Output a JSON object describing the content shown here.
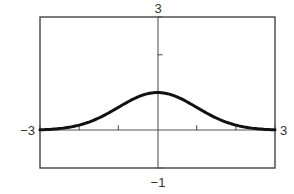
{
  "chart_data": {
    "type": "line",
    "title": "",
    "xlabel": "",
    "ylabel": "",
    "function": "y = e^(-x^2/2)",
    "xlim": [
      -3,
      3
    ],
    "ylim": [
      -1,
      3
    ],
    "grid": false,
    "legend": null,
    "x_tick_step": 1,
    "y_tick_step": 1,
    "window_labels": {
      "xmin": "−3",
      "xmax": "3",
      "ymin": "−1",
      "ymax": "3"
    },
    "series": [
      {
        "name": "curve",
        "x": [
          -3,
          -2.5,
          -2,
          -1.5,
          -1,
          -0.5,
          0,
          0.5,
          1,
          1.5,
          2,
          2.5,
          3
        ],
        "y": [
          0.01,
          0.04,
          0.14,
          0.32,
          0.61,
          0.88,
          1.0,
          0.88,
          0.61,
          0.32,
          0.14,
          0.04,
          0.01
        ]
      }
    ],
    "colors": {
      "curve": "#111111",
      "frame": "#444444",
      "axes": "#555555"
    }
  }
}
